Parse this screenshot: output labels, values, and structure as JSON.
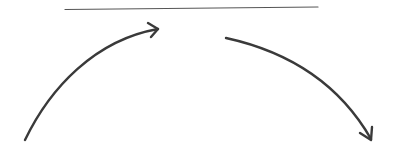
{
  "diagram": {
    "background": "#ffffff",
    "stroke_color": "#3a3a3a",
    "line_color": "#555555",
    "elements": [
      {
        "type": "line",
        "name": "top-horizontal-line",
        "from": [
          65,
          9
        ],
        "to": [
          318,
          7
        ]
      },
      {
        "type": "arrow",
        "name": "left-curved-arrow",
        "direction": "up-right",
        "from": [
          25,
          140
        ],
        "to": [
          158,
          29
        ]
      },
      {
        "type": "arrow",
        "name": "right-curved-arrow",
        "direction": "down-right",
        "from": [
          226,
          38
        ],
        "to": [
          372,
          140
        ]
      }
    ]
  }
}
